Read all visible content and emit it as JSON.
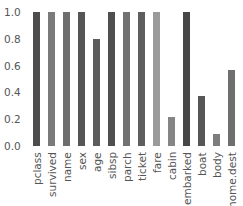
{
  "chart_data": {
    "type": "bar",
    "title": "",
    "xlabel": "",
    "ylabel": "",
    "ylim": [
      0,
      1.0
    ],
    "grid": false,
    "yticks": [
      "0.0",
      "0.2",
      "0.4",
      "0.6",
      "0.8",
      "1.0"
    ],
    "categories": [
      "pclass",
      "survived",
      "name",
      "sex",
      "age",
      "sibsp",
      "parch",
      "ticket",
      "fare",
      "cabin",
      "embarked",
      "boat",
      "body",
      "home.dest"
    ],
    "values": [
      1.0,
      1.0,
      1.0,
      1.0,
      0.8,
      1.0,
      1.0,
      1.0,
      1.0,
      0.22,
      1.0,
      0.37,
      0.09,
      0.57
    ],
    "colors": [
      "#4d4d4d",
      "#7a7a7a",
      "#6e6e6e",
      "#555555",
      "#5c5c5c",
      "#4f4f4f",
      "#727272",
      "#5e5e5e",
      "#9a9a9a",
      "#858585",
      "#474747",
      "#575757",
      "#7d7d7d",
      "#6f6f6f"
    ]
  }
}
